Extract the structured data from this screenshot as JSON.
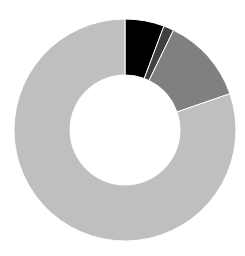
{
  "chart_data": {
    "type": "pie",
    "subtype": "donut",
    "title": "",
    "categories": [
      "Segment 1",
      "Segment 2",
      "Segment 3",
      "Segment 4"
    ],
    "values": [
      5.7,
      1.5,
      12.5,
      80.3
    ],
    "colors": [
      "#000000",
      "#404040",
      "#808080",
      "#bfbfbf"
    ],
    "start_angle_deg": 0,
    "direction": "clockwise",
    "inner_radius_ratio": 0.5,
    "legend": "none",
    "data_labels": "none"
  },
  "layout": {
    "cx": 125,
    "cy": 130,
    "outer_r": 111,
    "inner_r": 55,
    "separator_color": "#ffffff"
  }
}
